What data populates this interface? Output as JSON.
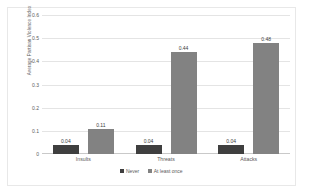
{
  "chart_data": {
    "type": "bar",
    "title": "",
    "xlabel": "",
    "ylabel": "Average Partisan Violence Index",
    "ylim": [
      0,
      0.6
    ],
    "ytick_labels": [
      "0.6",
      "0.5",
      "0.4",
      "0.3",
      "0.2",
      "0.1",
      "0"
    ],
    "ytick_values": [
      0.6,
      0.5,
      0.4,
      0.3,
      0.2,
      0.1,
      0
    ],
    "grid": true,
    "legend_position": "bottom",
    "categories": [
      "Insults",
      "Threats",
      "Attacks"
    ],
    "series": [
      {
        "name": "Never",
        "color": "#3f3f3f",
        "values": [
          0.04,
          0.04,
          0.04
        ],
        "labels": [
          "0.04",
          "0.04",
          "0.04"
        ]
      },
      {
        "name": "At least once",
        "color": "#828282",
        "values": [
          0.11,
          0.44,
          0.48
        ],
        "labels": [
          "0.11",
          "0.44",
          "0.48"
        ]
      }
    ]
  }
}
